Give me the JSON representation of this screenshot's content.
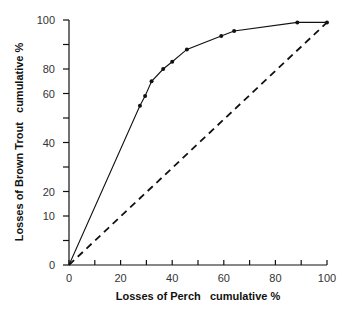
{
  "chart_data": {
    "type": "line",
    "title": "",
    "xlabel": "Losses of Perch   cumulative %",
    "ylabel": "Losses of Brown Trout   cumulative %",
    "xlim": [
      0,
      100
    ],
    "ylim": [
      0,
      100
    ],
    "grid": false,
    "legend": null,
    "x_ticks": [
      0,
      10,
      20,
      30,
      40,
      50,
      60,
      70,
      80,
      90,
      100
    ],
    "x_tick_labels": [
      {
        "label": "0",
        "pos": 0
      },
      {
        "label": "20",
        "pos": 20
      },
      {
        "label": "40",
        "pos": 40
      },
      {
        "label": "60",
        "pos": 60
      },
      {
        "label": "80",
        "pos": 80
      },
      {
        "label": "100",
        "pos": 100
      }
    ],
    "y_ticks": [
      0,
      10,
      20,
      30,
      40,
      50,
      60,
      70,
      80,
      90,
      100
    ],
    "y_tick_labels": [
      {
        "label": "0",
        "pos": 0
      },
      {
        "label": "10",
        "pos": 20
      },
      {
        "label": "20",
        "pos": 30
      },
      {
        "label": "40",
        "pos": 50
      },
      {
        "label": "60",
        "pos": 70
      },
      {
        "label": "80",
        "pos": 80
      },
      {
        "label": "100",
        "pos": 100
      }
    ],
    "series": [
      {
        "name": "Observed cumulative losses",
        "style": "solid-with-markers",
        "color": "#111111",
        "x": [
          0,
          27.5,
          29.5,
          32,
          36.5,
          40,
          45.7,
          59,
          64,
          88.5,
          100
        ],
        "y": [
          0,
          65,
          69,
          75,
          80,
          83,
          88,
          93.5,
          95.5,
          99,
          99
        ]
      },
      {
        "name": "Line of equality",
        "style": "dashed",
        "color": "#111111",
        "x": [
          0,
          100
        ],
        "y": [
          0,
          99
        ]
      }
    ]
  }
}
